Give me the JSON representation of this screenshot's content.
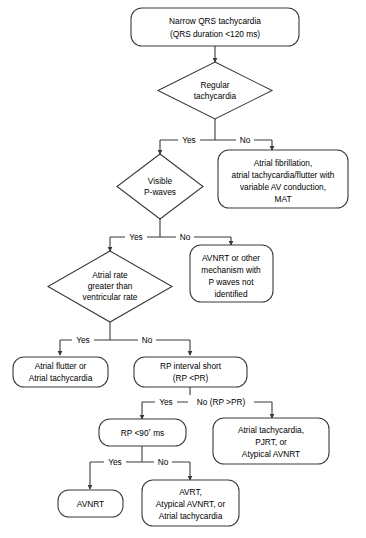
{
  "diagram": {
    "type": "flowchart",
    "colors": {
      "stroke": "#3a3a3a",
      "fill": "#ffffff",
      "text": "#000000"
    },
    "nodes": {
      "start": {
        "shape": "rounded-box",
        "lines": [
          "Narrow QRS tachycardia",
          "(QRS duration <120 ms)"
        ]
      },
      "regular_tachycardia": {
        "shape": "diamond",
        "lines": [
          "Regular",
          "tachycardia"
        ]
      },
      "afib_box": {
        "shape": "rounded-box",
        "lines": [
          "Atrial fibrillation,",
          "atrial tachycardia/flutter with",
          "variable AV conduction,",
          "MAT"
        ]
      },
      "visible_p_waves": {
        "shape": "diamond",
        "lines": [
          "Visible",
          "P-waves"
        ]
      },
      "avnrt_other_box": {
        "shape": "rounded-box",
        "lines": [
          "AVNRT or other",
          "mechanism with",
          "P waves not",
          "identified"
        ]
      },
      "atrial_rate_greater": {
        "shape": "diamond",
        "lines": [
          "Atrial rate",
          "greater than",
          "ventricular rate"
        ]
      },
      "atrial_flutter_box": {
        "shape": "rounded-box",
        "lines": [
          "Atrial flutter or",
          "Atrial tachycardia"
        ]
      },
      "rp_interval_short": {
        "shape": "rounded-box",
        "lines": [
          "RP interval short",
          "(RP <PR)"
        ]
      },
      "atrial_tach_pjrt_box": {
        "shape": "rounded-box",
        "lines": [
          "Atrial tachycardia,",
          "PJRT, or",
          "Atypical AVNRT"
        ]
      },
      "rp_90ms": {
        "shape": "rounded-box",
        "lines": [
          "RP <90* ms"
        ],
        "text_main": "RP <90",
        "text_sup": "*",
        "text_tail": " ms"
      },
      "avnrt_box": {
        "shape": "rounded-box",
        "lines": [
          "AVNRT"
        ]
      },
      "avrt_box": {
        "shape": "rounded-box",
        "lines": [
          "AVRT,",
          "Atypical AVNRT, or",
          "Atrial tachycardia"
        ]
      }
    },
    "edge_labels": {
      "regular_yes": "Yes",
      "regular_no": "No",
      "pwaves_yes": "Yes",
      "pwaves_no": "No",
      "atrialrate_yes": "Yes",
      "atrialrate_no": "No",
      "rp_yes": "Yes",
      "rp_no": "No (RP >PR)",
      "rp90_yes": "Yes",
      "rp90_no": "No"
    }
  }
}
